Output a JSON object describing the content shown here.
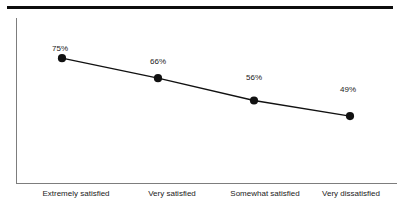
{
  "chart_data": {
    "type": "line",
    "title": "",
    "subtitle": "",
    "xlabel": "",
    "ylabel": "",
    "categories": [
      "Extremely satisfied",
      "Very satisfied",
      "Somewhat satisfied",
      "Very dissatisfied"
    ],
    "values": [
      75,
      66,
      56,
      49
    ],
    "point_labels": [
      "75%",
      "66%",
      "56%",
      "49%"
    ],
    "series": [
      {
        "name": "",
        "values": [
          75,
          66,
          56,
          49
        ]
      }
    ],
    "ylim": [
      0,
      100
    ],
    "grid": false,
    "legend": false,
    "legend_position": "none",
    "annotations": [],
    "colors": {
      "line": "#111111",
      "marker": "#111111",
      "axis": "#7d7d7d",
      "top_rule": "#0d0d0d",
      "background": "#ffffff",
      "text": "#1a1a1a"
    }
  },
  "figure": {
    "top_rule_present": true
  }
}
